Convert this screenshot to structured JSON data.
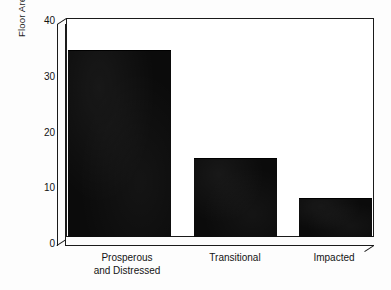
{
  "chart_data": {
    "type": "bar",
    "title": "",
    "subtitle": "",
    "categories": [
      "Prosperous and Distressed",
      "Transitional",
      "Impacted"
    ],
    "category_lines": [
      [
        "Prosperous",
        "and Distressed"
      ],
      [
        "Transitional",
        ""
      ],
      [
        "Impacted",
        ""
      ]
    ],
    "values": [
      34,
      14.2,
      7
    ],
    "xlabel": "",
    "ylabel": "Floor Area Per Person (M2)",
    "ylabel_lines": [
      "Floor Area Per Person",
      "(M"
    ],
    "ylabel_superscript": "2",
    "ylabel_closing": ")",
    "ylim": [
      0,
      40
    ],
    "yticks": [
      0,
      10,
      20,
      30,
      40
    ],
    "ytick_labels": [
      "0",
      "10",
      "20",
      "30",
      "40"
    ],
    "grid": false,
    "legend": false,
    "legend_position": "none",
    "bar_color": "#0b0b0b",
    "axis_color": "#1a1a1a",
    "plot_background": "#ffffff",
    "style": "3d-frame"
  }
}
